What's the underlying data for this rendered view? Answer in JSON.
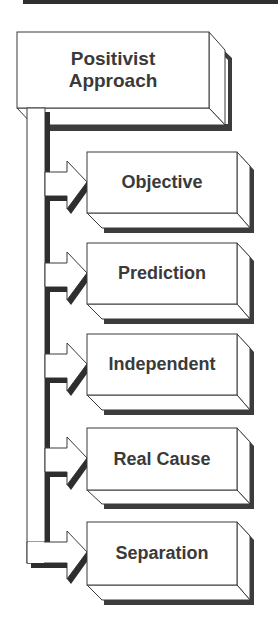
{
  "diagram": {
    "root": {
      "label_line1": "Positivist",
      "label_line2": "Approach"
    },
    "children": [
      {
        "label": "Objective"
      },
      {
        "label": "Prediction"
      },
      {
        "label": "Independent"
      },
      {
        "label": "Real Cause"
      },
      {
        "label": "Separation"
      }
    ],
    "colors": {
      "stroke": "#3a3a3a",
      "shadow": "#3c3c3c",
      "fill": "#ffffff",
      "text": "#3a3a3a",
      "header_bar": "#2e2e2e"
    }
  }
}
